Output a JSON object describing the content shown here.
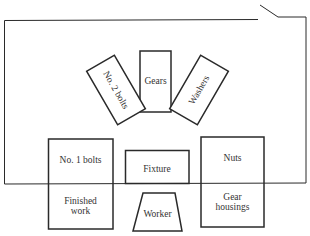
{
  "diagram": {
    "type": "workstation-layout",
    "stroke_color": "#2a2a2a",
    "background": "#ffffff",
    "bins": [
      {
        "id": "no2-bolts",
        "label": "No. 2 bolts",
        "rotation": 60
      },
      {
        "id": "gears",
        "label": "Gears",
        "rotation": 0
      },
      {
        "id": "washers",
        "label": "Washers",
        "rotation": -60
      },
      {
        "id": "no1-bolts",
        "label": "No. 1 bolts"
      },
      {
        "id": "fixture",
        "label": "Fixture"
      },
      {
        "id": "nuts",
        "label": "Nuts"
      },
      {
        "id": "finished-work",
        "label_line1": "Finished",
        "label_line2": "work"
      },
      {
        "id": "gear-housings",
        "label_line1": "Gear",
        "label_line2": "housings"
      }
    ],
    "worker": {
      "label": "Worker"
    }
  }
}
